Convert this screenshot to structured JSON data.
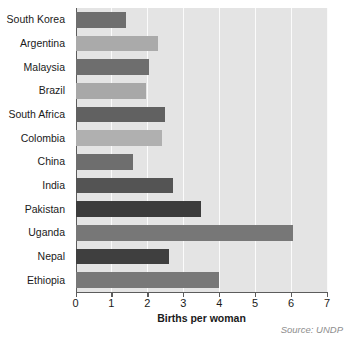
{
  "chart_data": {
    "type": "bar",
    "orientation": "horizontal",
    "title": "",
    "xlabel": "Births per woman",
    "ylabel": "",
    "xlim": [
      0,
      7
    ],
    "xticks": [
      0,
      1,
      2,
      3,
      4,
      5,
      6,
      7
    ],
    "xtick_labels": [
      "0",
      "1",
      "2",
      "3",
      "4",
      "5",
      "6",
      "7"
    ],
    "grid": "vertical-white",
    "legend": "none",
    "categories": [
      "South Korea",
      "Argentina",
      "Malaysia",
      "Brazil",
      "South Africa",
      "Colombia",
      "China",
      "India",
      "Pakistan",
      "Uganda",
      "Nepal",
      "Ethiopia"
    ],
    "values": [
      1.4,
      2.3,
      2.05,
      1.95,
      2.5,
      2.4,
      1.6,
      2.7,
      3.5,
      6.05,
      2.6,
      4.0
    ],
    "bar_colors": [
      "#6e6e6e",
      "#aaaaaa",
      "#6e6e6e",
      "#a8a8a8",
      "#616161",
      "#b0b0b0",
      "#6e6e6e",
      "#545454",
      "#3c3c3c",
      "#777777",
      "#3f3f3f",
      "#787878"
    ],
    "plot_background": "#e4e4e4",
    "gridline_color": "#fbfbfb",
    "axis_color": "#5c5c5c",
    "annotations": [
      "Source: UNDP"
    ]
  },
  "footer": {
    "source": "Source: UNDP"
  }
}
